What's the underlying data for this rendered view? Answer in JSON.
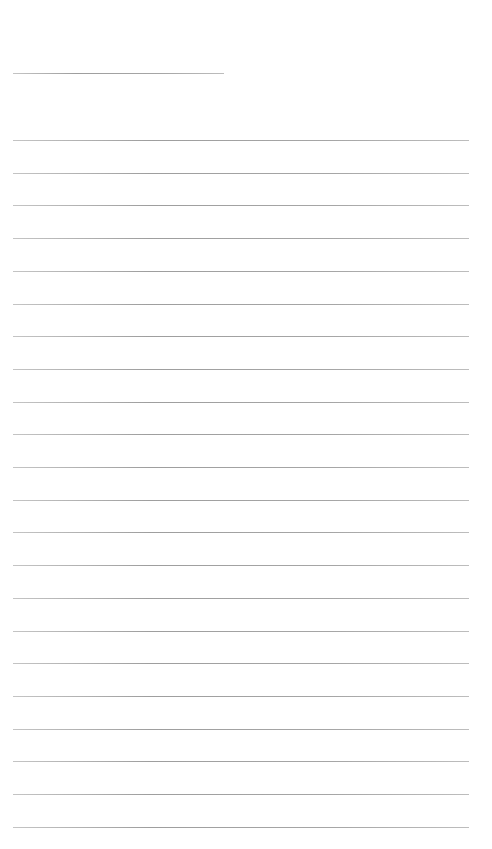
{
  "page": {
    "type": "blank-lined-sheet",
    "title_line": {
      "x": 13,
      "y": 73,
      "width": 211
    },
    "lines": {
      "count": 22,
      "x": 13,
      "width": 456,
      "first_y": 140,
      "spacing": 32.7
    },
    "colors": {
      "background": "#ffffff",
      "rule": "#a8a8a8"
    }
  }
}
